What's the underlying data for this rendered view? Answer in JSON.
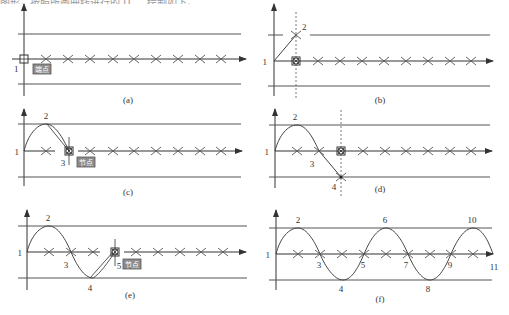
{
  "header": {
    "text": "图形，按照所画曲线进行的 U 、 绘制如下。"
  },
  "colors": {
    "line": "#555555",
    "curve": "#444444",
    "tag_bg": "#8c8c8c",
    "tag_border": "#555555",
    "text": "#333333"
  },
  "panels": [
    {
      "id": "a",
      "caption": "(a)",
      "points": [
        {
          "label": "1"
        }
      ],
      "tag": "端点",
      "description": "Endpoint snap marker at start point 1 on axis; crosses mark grid positions"
    },
    {
      "id": "b",
      "caption": "(b)",
      "points": [
        {
          "label": "1"
        },
        {
          "label": "2"
        }
      ],
      "description": "Line from point 1 to point 2 on upper line, with dotted vertical tracking guide"
    },
    {
      "id": "c",
      "caption": "(c)",
      "points": [
        {
          "label": "1"
        },
        {
          "label": "2"
        },
        {
          "label": "3"
        }
      ],
      "tag": "节点",
      "description": "Arc 1-2 with rubber band to node 3"
    },
    {
      "id": "d",
      "caption": "(d)",
      "points": [
        {
          "label": "1"
        },
        {
          "label": "2"
        },
        {
          "label": "3"
        },
        {
          "label": "4"
        }
      ],
      "description": "Curve through 1,2,3 extending to point 4 on lower line, dotted guide"
    },
    {
      "id": "e",
      "caption": "(e)",
      "points": [
        {
          "label": "1"
        },
        {
          "label": "2"
        },
        {
          "label": "3"
        },
        {
          "label": "4"
        },
        {
          "label": "5"
        }
      ],
      "tag": "节点",
      "description": "Curve through 1-4 with rubber band to node 5"
    },
    {
      "id": "f",
      "caption": "(f)",
      "points": [
        {
          "label": "1"
        },
        {
          "label": "2"
        },
        {
          "label": "3"
        },
        {
          "label": "4"
        },
        {
          "label": "5"
        },
        {
          "label": "6"
        },
        {
          "label": "7"
        },
        {
          "label": "8"
        },
        {
          "label": "9"
        },
        {
          "label": "10"
        },
        {
          "label": "11"
        }
      ],
      "description": "Completed sine-like spline through points 1 to 11"
    }
  ]
}
